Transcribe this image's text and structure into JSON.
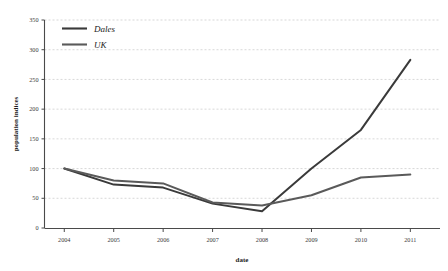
{
  "chart_data": {
    "type": "line",
    "title": "",
    "xlabel": "date",
    "ylabel": "population indices",
    "categories": [
      "2004",
      "2005",
      "2006",
      "2007",
      "2008",
      "2009",
      "2010",
      "2011"
    ],
    "x": [
      2004,
      2005,
      2006,
      2007,
      2008,
      2009,
      2010,
      2011
    ],
    "xlim": [
      2003.6,
      2011.6
    ],
    "ylim": [
      0,
      350
    ],
    "yticks": [
      0,
      50,
      100,
      150,
      200,
      250,
      300,
      350
    ],
    "ytick_labels": [
      "0",
      "50",
      "100",
      "150",
      "200",
      "250",
      "300",
      "350"
    ],
    "xtick_labels": [
      "2004",
      "2005",
      "2006",
      "2007",
      "2008",
      "2009",
      "2010",
      "2011"
    ],
    "grid": true,
    "grid_axis": "y",
    "grid_style": "dashed",
    "legend_position": "top-left",
    "series": [
      {
        "name": "Dales",
        "color": "#3a3a3a",
        "values": [
          100,
          73,
          68,
          41,
          28,
          100,
          165,
          283
        ]
      },
      {
        "name": "UK",
        "color": "#5a5a5a",
        "values": [
          100,
          80,
          75,
          43,
          38,
          55,
          85,
          90
        ]
      }
    ]
  },
  "legend": {
    "items": [
      {
        "label": "Dales"
      },
      {
        "label": "UK"
      }
    ]
  },
  "axes": {
    "x_title": "date",
    "y_title": "population indices"
  },
  "colors": {
    "series_dales": "#3a3a3a",
    "series_uk": "#5a5a5a",
    "axis": "#4a4a4a",
    "grid": "#bdbdbd",
    "text": "#3c3c3c",
    "background": "#ffffff"
  }
}
